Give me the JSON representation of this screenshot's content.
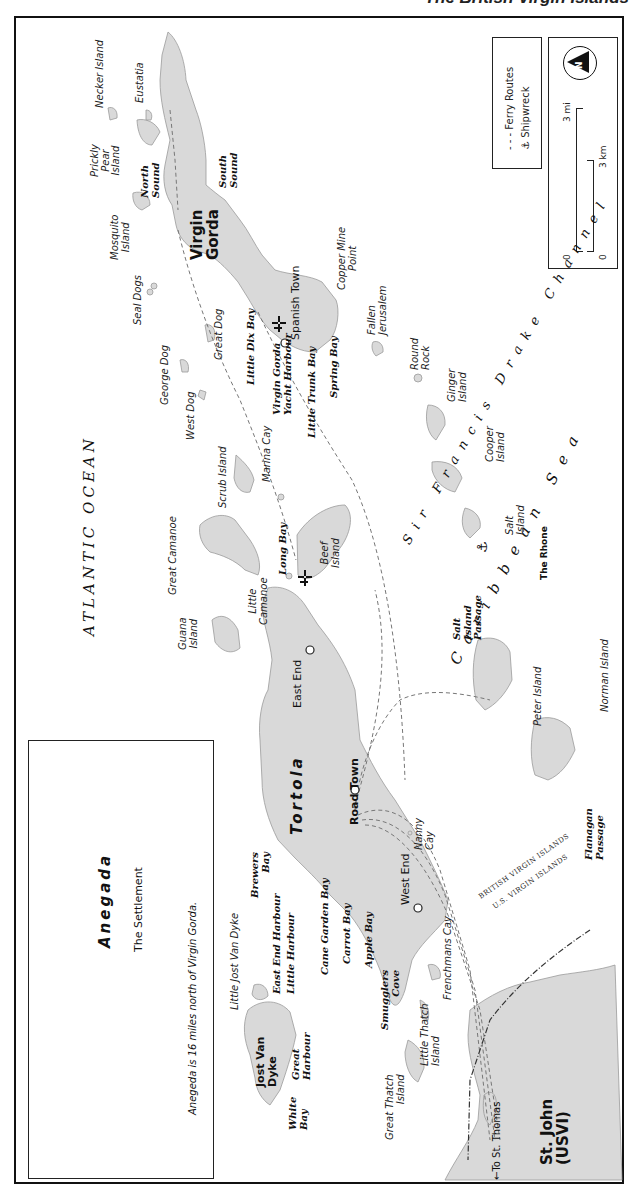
{
  "title": "The British Virgin Islands",
  "legend": {
    "ferry_routes": "Ferry Routes",
    "shipwreck": "Shipwreck",
    "shipwreck_icon": "anchor-icon"
  },
  "scale": {
    "compass": "N",
    "miles_label": "3 mi",
    "km_label": "3 km",
    "zero_mi": "0",
    "zero_km": "0"
  },
  "inset": {
    "island": "Anegada",
    "settlement": "The Settlement",
    "note": "Anegeda is 16 miles north of Virgin Gorda."
  },
  "water_bodies": {
    "atlantic": "ATLANTIC OCEAN",
    "caribbean": "Caribbean Sea",
    "channel": "Sir Francis Drake Channel",
    "channel_parts": [
      "Sir",
      "Francis",
      "Drake",
      "Channel"
    ]
  },
  "border": {
    "bvi": "BRITISH VIRGIN ISLANDS",
    "usvi": "U.S. VIRGIN ISLANDS"
  },
  "major_islands": {
    "tortola": "Tortola",
    "virgin_gorda": [
      "Virgin",
      "Gorda"
    ],
    "jost_van_dyke": [
      "Jost Van",
      "Dyke"
    ],
    "st_john": [
      "St. John",
      "(USVI)"
    ]
  },
  "towns": {
    "road_town": "Road Town",
    "east_end": "East End",
    "west_end": "West End",
    "spanish_town": "Spanish Town"
  },
  "islands": {
    "necker": "Necker Island",
    "eustatia": "Eustatia",
    "prickly_pear": [
      "Prickly",
      "Pear",
      "Island"
    ],
    "mosquito": [
      "Mosquito",
      "Island"
    ],
    "seal_dogs": "Seal Dogs",
    "george_dog": "George Dog",
    "great_dog": "Great Dog",
    "west_dog": "West Dog",
    "scrub": "Scrub Island",
    "marina_cay": "Marina Cay",
    "great_camanoe": "Great Camanoe",
    "little_camanoe": [
      "Little",
      "Camanoe"
    ],
    "beef": [
      "Beef",
      "Island"
    ],
    "guana": [
      "Guana",
      "Island"
    ],
    "copper_mine": [
      "Copper Mine",
      "Point"
    ],
    "fallen_jerusalem": [
      "Fallen",
      "Jerusalem"
    ],
    "round_rock": [
      "Round",
      "Rock"
    ],
    "ginger": [
      "Ginger",
      "Island"
    ],
    "cooper": [
      "Cooper",
      "Island"
    ],
    "salt": [
      "Salt",
      "Island"
    ],
    "peter": "Peter Island",
    "norman": "Norman Island",
    "nanny_cay": [
      "Nanny",
      "Cay"
    ],
    "frenchmans_cay": "Frenchmans Cay",
    "little_thatch": [
      "Little Thatch",
      "Island"
    ],
    "great_thatch": [
      "Great Thatch",
      "Island"
    ],
    "little_jost": "Little Jost Van Dyke"
  },
  "bays": {
    "north_sound": [
      "North",
      "Sound"
    ],
    "south_sound": [
      "South",
      "Sound"
    ],
    "little_dix": "Little Dix Bay",
    "vg_yacht": [
      "Virgin Gorda",
      "Yacht Harbour"
    ],
    "little_trunk": "Little Trunk Bay",
    "spring": "Spring Bay",
    "long_bay": "Long Bay",
    "salt_passage": [
      "Salt",
      "Island",
      "Passage"
    ],
    "brewers": [
      "Brewers",
      "Bay"
    ],
    "east_end_harbour": "East End Harbour",
    "little_harbour": "Little Harbour",
    "cane_garden": "Cane Garden Bay",
    "carrot": "Carrot Bay",
    "apple": "Apple Bay",
    "smugglers": [
      "Smugglers",
      "Cove"
    ],
    "great_harbour": [
      "Great",
      "Harbour"
    ],
    "white_bay": [
      "White",
      "Bay"
    ],
    "flanagan": [
      "Flanagan",
      "Passage"
    ]
  },
  "wreck": "The Rhone",
  "to_st_thomas": "←To St. Thomas",
  "colors": {
    "land": "#d9d9d9",
    "land_stroke": "#9a9a9a",
    "border": "#111111",
    "water": "#ffffff"
  }
}
